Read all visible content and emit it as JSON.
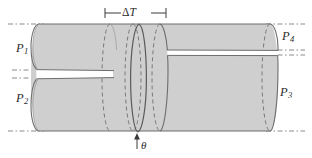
{
  "figure": {
    "type": "engineering-cylinder-diagram",
    "width": 312,
    "height": 158,
    "background_color": "#ffffff",
    "body_fill_color": "#cfcfcf",
    "body_stroke_color": "#6e6e6e",
    "dashed_stroke_color": "#7a7a7a",
    "dashdot_stroke_color": "#8a8a8a",
    "gap_fill_color": "#ffffff",
    "text_color": "#2b2b2b"
  },
  "labels": {
    "p1": "P",
    "p1_sub": "1",
    "p2": "P",
    "p2_sub": "2",
    "p3": "P",
    "p3_sub": "3",
    "p4": "P",
    "p4_sub": "4",
    "delta_t_prefix": "Δ",
    "delta_t_symbol": "T",
    "theta": "θ"
  },
  "annotations": {
    "dimension": {
      "name": "delta-T",
      "text": "ΔT",
      "x_start": 105,
      "x_end": 166,
      "y": 13
    },
    "angle": {
      "name": "theta",
      "text": "θ",
      "arrow_x": 137,
      "arrow_y_tip": 134,
      "arrow_y_tail": 149,
      "label_x": 143,
      "label_y": 147
    }
  },
  "geometry": {
    "top_line_y": 24,
    "bottom_line_y": 131,
    "left_split_upper_y": 70,
    "left_split_lower_y": 78,
    "right_split_upper_y": 50,
    "right_split_lower_y": 55,
    "left_face_x": 39,
    "right_face_x": 270,
    "ellipse_rx": 6,
    "section_breaks_x": [
      110,
      133,
      140,
      160
    ]
  },
  "parts": [
    {
      "id": "P1",
      "label": "P",
      "sub": "1",
      "x": 18,
      "y": 48,
      "region": "left-upper"
    },
    {
      "id": "P2",
      "label": "P",
      "sub": "2",
      "x": 18,
      "y": 98,
      "region": "left-lower"
    },
    {
      "id": "P3",
      "label": "P",
      "sub": "3",
      "x": 281,
      "y": 92,
      "region": "right-lower"
    },
    {
      "id": "P4",
      "label": "P",
      "sub": "4",
      "x": 283,
      "y": 37,
      "region": "right-upper"
    }
  ]
}
